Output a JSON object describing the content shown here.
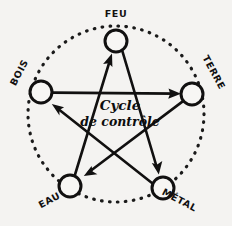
{
  "diagram": {
    "title": "Cycle de contrôle",
    "center_text": {
      "line1": "Cycle",
      "line2": "de contrôle"
    },
    "style": {
      "background_color": "#f4f3f1",
      "ink_color": "#111010",
      "node_fill": "#f7f6f4",
      "dotted_ring": true,
      "ring_center": [
        116,
        114
      ],
      "ring_radius": 88
    },
    "nodes": [
      {
        "id": "feu",
        "label": "FEU",
        "cx": 116,
        "cy": 41,
        "r": 11,
        "label_x": 116,
        "label_y": 17,
        "label_rotation": 0
      },
      {
        "id": "terre",
        "label": "TERRE",
        "cx": 192,
        "cy": 94,
        "r": 11,
        "label_x": 211,
        "label_y": 74,
        "label_rotation": 62
      },
      {
        "id": "metal",
        "label": "MÉTAL",
        "cx": 163,
        "cy": 188,
        "r": 11,
        "label_x": 178,
        "label_y": 203,
        "label_rotation": 28
      },
      {
        "id": "eau",
        "label": "EAU",
        "cx": 70,
        "cy": 186,
        "r": 11,
        "label_x": 51,
        "label_y": 203,
        "label_rotation": -28
      },
      {
        "id": "bois",
        "label": "BOIS",
        "cx": 41,
        "cy": 92,
        "r": 11,
        "label_x": 22,
        "label_y": 74,
        "label_rotation": -62
      }
    ],
    "arrows": [
      {
        "id": "bois-terre",
        "from": "bois",
        "to": "terre",
        "label": "Bois contrôle Terre"
      },
      {
        "id": "terre-eau",
        "from": "terre",
        "to": "eau",
        "label": "Terre contrôle Eau"
      },
      {
        "id": "eau-feu",
        "from": "eau",
        "to": "feu",
        "label": "Eau contrôle Feu"
      },
      {
        "id": "feu-metal",
        "from": "feu",
        "to": "metal",
        "label": "Feu contrôle Métal"
      },
      {
        "id": "metal-bois",
        "from": "metal",
        "to": "bois",
        "label": "Métal contrôle Bois"
      }
    ]
  }
}
